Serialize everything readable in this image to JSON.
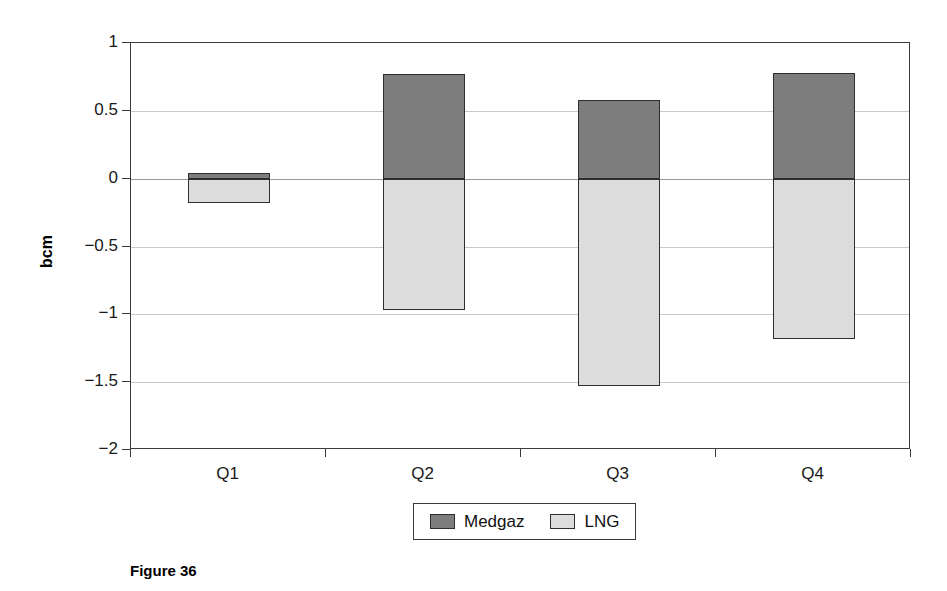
{
  "chart_data": {
    "type": "bar",
    "title": "",
    "subtitle": "",
    "xlabel": "",
    "ylabel": "bcm",
    "categories": [
      "Q1",
      "Q2",
      "Q3",
      "Q4"
    ],
    "series": [
      {
        "name": "Medgaz",
        "color": "#7d7d7d",
        "values": [
          0.04,
          0.77,
          0.58,
          0.78
        ]
      },
      {
        "name": "LNG",
        "color": "#dcdcdc",
        "values": [
          -0.18,
          -0.97,
          -1.53,
          -1.18
        ]
      }
    ],
    "ylim": [
      -2,
      1
    ],
    "yticks": [
      1,
      0.5,
      0,
      -0.5,
      -1,
      -1.5,
      -2
    ],
    "ytick_labels": [
      "1",
      "0.5",
      "0",
      "−0.5",
      "−1",
      "−1.5",
      "−2"
    ],
    "grid": true,
    "stacked": true,
    "legend_position": "bottom",
    "legend_entries": [
      "Medgaz",
      "LNG"
    ]
  },
  "caption": {
    "text": "Figure 36"
  }
}
